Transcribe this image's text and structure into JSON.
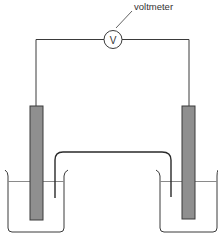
{
  "diagram": {
    "title": "",
    "voltmeter_label": "voltmeter",
    "voltmeter_symbol": "V",
    "colors": {
      "line": "#3a3a3a",
      "electrode_fill": "#8f8f8f",
      "liquid_line": "#8a8a8a",
      "background": "#ffffff"
    },
    "components": [
      {
        "name": "voltmeter",
        "label": "voltmeter"
      },
      {
        "name": "left-electrode"
      },
      {
        "name": "right-electrode"
      },
      {
        "name": "left-beaker"
      },
      {
        "name": "right-beaker"
      },
      {
        "name": "salt-bridge"
      },
      {
        "name": "external-wire"
      }
    ]
  }
}
